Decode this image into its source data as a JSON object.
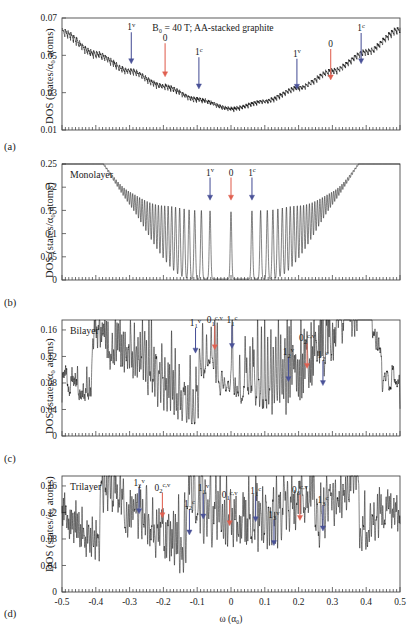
{
  "figure": {
    "title": "B₀ = 40 T; AA-stacked graphite",
    "xlabel": "ω (α₀)",
    "ylabel": "DOS (states/α₀ atoms)",
    "xticks": [
      "-0.5",
      "-0.4",
      "-0.3",
      "-0.2",
      "-0.1",
      "0",
      "0.1",
      "0.2",
      "0.3",
      "0.4",
      "0.5"
    ],
    "xtickvals": [
      -0.5,
      -0.4,
      -0.3,
      -0.2,
      -0.1,
      0,
      0.1,
      0.2,
      0.3,
      0.4,
      0.5
    ],
    "colors": {
      "blue_arrow": "#4a5298",
      "red_arrow": "#e06050",
      "curve": "#111111",
      "axis": "#4a4a4a"
    }
  },
  "panels": [
    {
      "tag": "(a)",
      "inset_label": "",
      "title": "B₀ = 40 T; AA-stacked graphite",
      "yticks": [
        "0.01",
        "0.03",
        "0.05",
        "0.07"
      ],
      "ytickvals": [
        0.01,
        0.03,
        0.05,
        0.07
      ],
      "ylim": [
        0.01,
        0.07
      ],
      "annotations": [
        {
          "base": "1",
          "sup": "v",
          "sub": "",
          "x": -0.295,
          "color": "blue",
          "ytip": 0.0455,
          "ytext": 0.0635
        },
        {
          "base": "0",
          "sup": "",
          "sub": "",
          "x": -0.195,
          "color": "red",
          "ytip": 0.0385,
          "ytext": 0.0575
        },
        {
          "base": "1",
          "sup": "c",
          "sub": "",
          "x": -0.095,
          "color": "blue",
          "ytip": 0.032,
          "ytext": 0.05
        },
        {
          "base": "1",
          "sup": "v",
          "sub": "",
          "x": 0.195,
          "color": "blue",
          "ytip": 0.0318,
          "ytext": 0.0492
        },
        {
          "base": "0",
          "sup": "",
          "sub": "",
          "x": 0.295,
          "color": "red",
          "ytip": 0.0368,
          "ytext": 0.0545
        },
        {
          "base": "1",
          "sup": "c",
          "sub": "",
          "x": 0.385,
          "color": "blue",
          "ytip": 0.0455,
          "ytext": 0.063
        }
      ]
    },
    {
      "tag": "(b)",
      "inset_label": "Monolayer",
      "title": "",
      "yticks": [
        "0",
        "0.05",
        "0.1",
        "0.15",
        "0.2",
        "0.25"
      ],
      "ytickvals": [
        0,
        0.05,
        0.1,
        0.15,
        0.2,
        0.25
      ],
      "ylim": [
        0,
        0.25
      ],
      "annotations": [
        {
          "base": "1",
          "sup": "v",
          "sub": "",
          "x": -0.062,
          "color": "blue",
          "ytip": 0.172,
          "ytext": 0.225
        },
        {
          "base": "0",
          "sup": "",
          "sub": "",
          "x": 0.0,
          "color": "red",
          "ytip": 0.172,
          "ytext": 0.225
        },
        {
          "base": "1",
          "sup": "c",
          "sub": "",
          "x": 0.062,
          "color": "blue",
          "ytip": 0.172,
          "ytext": 0.225
        }
      ]
    },
    {
      "tag": "(c)",
      "inset_label": "Bilayer",
      "title": "",
      "yticks": [
        "0",
        "0.04",
        "0.08",
        "0.12",
        "0.16"
      ],
      "ytickvals": [
        0,
        0.04,
        0.08,
        0.12,
        0.16
      ],
      "ylim": [
        0,
        0.175
      ],
      "annotations": [
        {
          "base": "1",
          "sup": "v",
          "sub": "1",
          "x": -0.105,
          "color": "blue",
          "ytip": 0.125,
          "ytext": 0.166
        },
        {
          "base": "0",
          "sup": "c,v",
          "sub": "1",
          "x": -0.048,
          "color": "red",
          "ytip": 0.13,
          "ytext": 0.17
        },
        {
          "base": "1",
          "sup": "c",
          "sub": "1",
          "x": 0.003,
          "color": "blue",
          "ytip": 0.132,
          "ytext": 0.17
        },
        {
          "base": "1",
          "sup": "v",
          "sub": "2",
          "x": 0.17,
          "color": "blue",
          "ytip": 0.082,
          "ytext": 0.122
        },
        {
          "base": "0",
          "sup": "c,v",
          "sub": "2",
          "x": 0.225,
          "color": "red",
          "ytip": 0.102,
          "ytext": 0.143
        },
        {
          "base": "1",
          "sup": "c",
          "sub": "2",
          "x": 0.272,
          "color": "blue",
          "ytip": 0.076,
          "ytext": 0.117
        }
      ]
    },
    {
      "tag": "(d)",
      "inset_label": "Trilayer",
      "title": "",
      "yticks": [
        "0",
        "0.04",
        "0.08",
        "0.12",
        "0.16"
      ],
      "ytickvals": [
        0,
        0.04,
        0.08,
        0.12,
        0.16
      ],
      "ylim": [
        0,
        0.175
      ],
      "annotations": [
        {
          "base": "1",
          "sup": "v",
          "sub": "2",
          "x": -0.272,
          "color": "blue",
          "ytip": 0.118,
          "ytext": 0.16
        },
        {
          "base": "0",
          "sup": "c,v",
          "sub": "2",
          "x": -0.203,
          "color": "red",
          "ytip": 0.112,
          "ytext": 0.153
        },
        {
          "base": "1",
          "sup": "c",
          "sub": "2",
          "x": -0.123,
          "color": "blue",
          "ytip": 0.086,
          "ytext": 0.128
        },
        {
          "base": "1",
          "sup": "v",
          "sub": "1",
          "x": -0.082,
          "color": "blue",
          "ytip": 0.11,
          "ytext": 0.152
        },
        {
          "base": "0",
          "sup": "c,v",
          "sub": "1",
          "x": -0.004,
          "color": "red",
          "ytip": 0.1,
          "ytext": 0.142
        },
        {
          "base": "1",
          "sup": "c",
          "sub": "1",
          "x": 0.073,
          "color": "blue",
          "ytip": 0.106,
          "ytext": 0.148
        },
        {
          "base": "1",
          "sup": "v",
          "sub": "3",
          "x": 0.127,
          "color": "blue",
          "ytip": 0.07,
          "ytext": 0.112
        },
        {
          "base": "0",
          "sup": "c,v",
          "sub": "3",
          "x": 0.204,
          "color": "red",
          "ytip": 0.108,
          "ytext": 0.15
        },
        {
          "base": "1",
          "sup": "c",
          "sub": "3",
          "x": 0.272,
          "color": "blue",
          "ytip": 0.092,
          "ytext": 0.134
        }
      ]
    }
  ],
  "chart_data": {
    "type": "line",
    "title": "B₀ = 40 T; AA-stacked graphite",
    "xlabel": "ω (α₀)",
    "ylabel": "DOS (states/α₀ atoms)",
    "xlim": [
      -0.5,
      0.5
    ],
    "grid": false,
    "legend": "none",
    "subplots": [
      {
        "panel": "(a)",
        "name": "AA-stacked graphite",
        "ylim": [
          0.01,
          0.07
        ],
        "description": "broad U-shaped background with dense fine Landau-level oscillations; minimum ≈0.019 near ω=0, rising to ≈0.065 at both ends",
        "baseline_points": {
          "x": [
            -0.5,
            -0.4,
            -0.3,
            -0.2,
            -0.1,
            0,
            0.1,
            0.2,
            0.3,
            0.4,
            0.5
          ],
          "y": [
            0.062,
            0.05,
            0.041,
            0.033,
            0.026,
            0.021,
            0.025,
            0.032,
            0.041,
            0.051,
            0.063
          ]
        },
        "oscillation_amplitude": 0.0035,
        "oscillation_count": 118
      },
      {
        "panel": "(b)",
        "name": "Monolayer",
        "ylim": [
          0,
          0.25
        ],
        "description": "sharp symmetric Landau-level delta peaks; envelope falls from ≈0.21 at |ω|=0.5 to ≈0.145 near ω=0; peaks sparse near center, dense at edges; baseline ≈0",
        "envelope_points": {
          "x": [
            -0.5,
            -0.4,
            -0.3,
            -0.2,
            -0.1,
            0,
            0.1,
            0.2,
            0.3,
            0.4,
            0.5
          ],
          "y": [
            0.205,
            0.188,
            0.172,
            0.158,
            0.148,
            0.145,
            0.148,
            0.158,
            0.172,
            0.188,
            0.205
          ]
        },
        "peak_spacing_rule": "sqrt-n Landau level spacing",
        "peak_count": 71
      },
      {
        "panel": "(c)",
        "name": "Bilayer",
        "ylim": [
          0,
          0.175
        ],
        "description": "two interleaved Landau-level sub-band groups; typical peaks 0.06-0.13, troughs 0.01-0.04; mean level ≈0.055",
        "baseline_points": {
          "x": [
            -0.5,
            -0.4,
            -0.3,
            -0.2,
            -0.1,
            0,
            0.1,
            0.2,
            0.3,
            0.4,
            0.5
          ],
          "y": [
            0.06,
            0.055,
            0.052,
            0.048,
            0.044,
            0.042,
            0.044,
            0.048,
            0.053,
            0.058,
            0.064
          ]
        },
        "peak_max": 0.135,
        "peak_count": 150
      },
      {
        "panel": "(d)",
        "name": "Trilayer",
        "ylim": [
          0,
          0.175
        ],
        "description": "three interleaved Landau-level sub-band groups; dense peaks 0.05-0.15, mean ≈0.05",
        "baseline_points": {
          "x": [
            -0.5,
            -0.4,
            -0.3,
            -0.2,
            -0.1,
            0,
            0.1,
            0.2,
            0.3,
            0.4,
            0.5
          ],
          "y": [
            0.058,
            0.054,
            0.05,
            0.046,
            0.043,
            0.041,
            0.043,
            0.046,
            0.05,
            0.055,
            0.06
          ]
        },
        "peak_max": 0.148,
        "peak_count": 190
      }
    ]
  }
}
